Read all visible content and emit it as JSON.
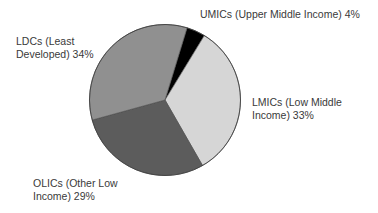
{
  "chart_data": {
    "type": "pie",
    "title": "",
    "start_angle_deg": 17,
    "direction": "clockwise",
    "slices": [
      {
        "name": "UMICs (Upper Middle Income)",
        "value": 4,
        "color": "#000000"
      },
      {
        "name": "LMICs (Low Middle Income)",
        "value": 33,
        "color": "#d6d6d6"
      },
      {
        "name": "OLICs (Other Low Income)",
        "value": 29,
        "color": "#5c5c5c"
      },
      {
        "name": "LDCs (Least Developed)",
        "value": 34,
        "color": "#909090"
      }
    ],
    "categories": [
      "UMICs (Upper Middle Income)",
      "LMICs (Low Middle Income)",
      "OLICs (Other Low Income)",
      "LDCs (Least Developed)"
    ],
    "values": [
      4,
      33,
      29,
      34
    ],
    "unit": "%",
    "legend": "none (direct labels)"
  },
  "labels": {
    "umics": {
      "line1": "UMICs (Upper Middle Income) 4%"
    },
    "lmics": {
      "line1": "LMICs (Low Middle",
      "line2": "Income) 33%"
    },
    "olics": {
      "line1": "OLICs (Other Low",
      "line2": "Income) 29%"
    },
    "ldcs": {
      "line1": "LDCs (Least",
      "line2": "Developed) 34%"
    }
  }
}
